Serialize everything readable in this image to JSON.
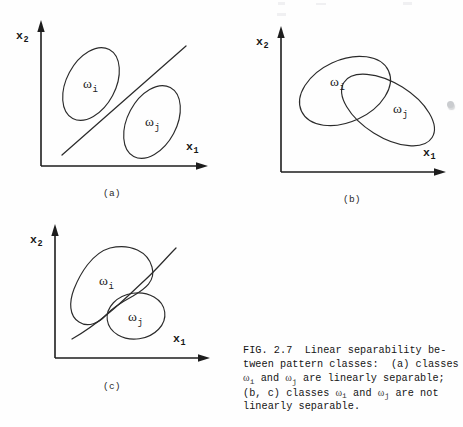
{
  "figure": {
    "axes": {
      "x_label": "x",
      "x_sub": "1",
      "y_label": "x",
      "y_sub": "2"
    },
    "classes": {
      "omega": "ω",
      "sub_i": "i",
      "sub_j": "j"
    },
    "panels": [
      {
        "id": "a",
        "tag": "(a)",
        "boundary_type": "straight-line",
        "description": "two disjoint tilted ellipses separated by a straight line",
        "regions": [
          {
            "name": "omega-i",
            "label_sub": "i"
          },
          {
            "name": "omega-j",
            "label_sub": "j"
          }
        ]
      },
      {
        "id": "b",
        "tag": "(b)",
        "boundary_type": "none",
        "description": "two overlapping tilted ellipses, no separating boundary",
        "regions": [
          {
            "name": "omega-i",
            "label_sub": "i"
          },
          {
            "name": "omega-j",
            "label_sub": "j"
          }
        ]
      },
      {
        "id": "c",
        "tag": "(c)",
        "boundary_type": "curved-line",
        "description": "concave blob and ellipse separated by a curved boundary",
        "regions": [
          {
            "name": "omega-i",
            "label_sub": "i"
          },
          {
            "name": "omega-j",
            "label_sub": "j"
          }
        ]
      }
    ]
  },
  "caption": {
    "lines": [
      "FIG. 2.7  Linear separability be-",
      "tween pattern classes:  (a) classes",
      "ωi and ωj are linearly separable;",
      "(b, c) classes ωi and ωj are not",
      "linearly separable."
    ],
    "line1_a": "FIG. 2.7  Linear separability be-",
    "line2": "tween pattern classes:  (a) classes",
    "line3_pre": "",
    "line3_mid": " and ",
    "line3_post": " are linearly separable;",
    "line4_pre": "(b, c) classes ",
    "line4_mid": " and ",
    "line4_post": " are not",
    "line5": "linearly separable."
  },
  "colors": {
    "ink": "#1d1d1d",
    "stroke": "#2b2b2b",
    "page": "#ffffff"
  }
}
